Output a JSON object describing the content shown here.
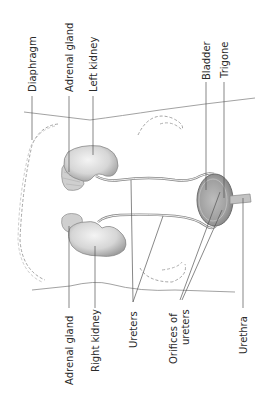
{
  "diagram": {
    "orientation": "rotated-90-ccw",
    "labels_top": [
      {
        "id": "diaphragm",
        "text": "Diaphragm"
      },
      {
        "id": "adrenal-gland-left",
        "text": "Adrenal gland"
      },
      {
        "id": "left-kidney",
        "text": "Left kidney"
      },
      {
        "id": "bladder",
        "text": "Bladder"
      },
      {
        "id": "trigone",
        "text": "Trigone"
      }
    ],
    "labels_bottom": [
      {
        "id": "adrenal-gland-right",
        "text": "Adrenal gland"
      },
      {
        "id": "right-kidney",
        "text": "Right kidney"
      },
      {
        "id": "ureters",
        "text": "Ureters"
      },
      {
        "id": "orifices-of-ureters",
        "text_line1": "Orifices of",
        "text_line2": "ureters"
      },
      {
        "id": "urethra",
        "text": "Urethra"
      }
    ],
    "colors": {
      "line": "#555555",
      "organ_fill": "#dcdcdc",
      "organ_shade": "#a8a8a8",
      "dashed": "#9a9a9a",
      "text": "#2a2a2a"
    }
  }
}
